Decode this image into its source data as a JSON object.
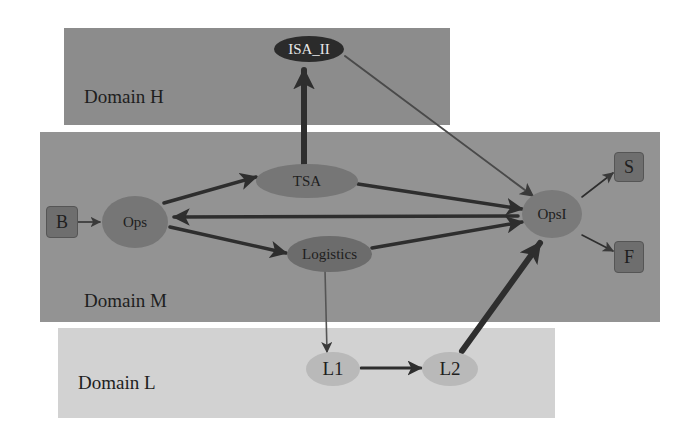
{
  "colors": {
    "domain_h": "#8c8c8c",
    "domain_m": "#939393",
    "domain_l": "#d2d2d2",
    "node_mid": "#767676",
    "node_dark": "#2b2b2b",
    "node_light": "#b9b9b9",
    "square": "#6e6e6e",
    "edge": "#2e2e2e"
  },
  "domains": {
    "h": {
      "label": "Domain H"
    },
    "m": {
      "label": "Domain M"
    },
    "l": {
      "label": "Domain L"
    }
  },
  "nodes": {
    "isa_ii": {
      "label": "ISA_II",
      "shape": "ellipse",
      "domain": "H"
    },
    "tsa": {
      "label": "TSA",
      "shape": "ellipse",
      "domain": "M"
    },
    "ops": {
      "label": "Ops",
      "shape": "ellipse",
      "domain": "M"
    },
    "logistics": {
      "label": "Logistics",
      "shape": "ellipse",
      "domain": "M"
    },
    "opsi": {
      "label": "OpsI",
      "shape": "ellipse",
      "domain": "M"
    },
    "b": {
      "label": "B",
      "shape": "square",
      "domain": "M"
    },
    "s": {
      "label": "S",
      "shape": "square",
      "domain": "M"
    },
    "f": {
      "label": "F",
      "shape": "square",
      "domain": "M"
    },
    "l1": {
      "label": "L1",
      "shape": "ellipse",
      "domain": "L"
    },
    "l2": {
      "label": "L2",
      "shape": "ellipse",
      "domain": "L"
    }
  },
  "edges": [
    {
      "from": "B",
      "to": "Ops",
      "weight": "thin"
    },
    {
      "from": "Ops",
      "to": "TSA",
      "weight": "medium"
    },
    {
      "from": "Ops",
      "to": "Logistics",
      "weight": "medium"
    },
    {
      "from": "OpsI",
      "to": "Ops",
      "weight": "medium"
    },
    {
      "from": "TSA",
      "to": "ISA_II",
      "weight": "thick"
    },
    {
      "from": "TSA",
      "to": "OpsI",
      "weight": "medium"
    },
    {
      "from": "Logistics",
      "to": "OpsI",
      "weight": "medium"
    },
    {
      "from": "ISA_II",
      "to": "OpsI",
      "weight": "thin"
    },
    {
      "from": "OpsI",
      "to": "S",
      "weight": "thin"
    },
    {
      "from": "OpsI",
      "to": "F",
      "weight": "thin"
    },
    {
      "from": "Logistics",
      "to": "L1",
      "weight": "thin"
    },
    {
      "from": "L1",
      "to": "L2",
      "weight": "medium"
    },
    {
      "from": "L2",
      "to": "OpsI",
      "weight": "thick"
    }
  ]
}
